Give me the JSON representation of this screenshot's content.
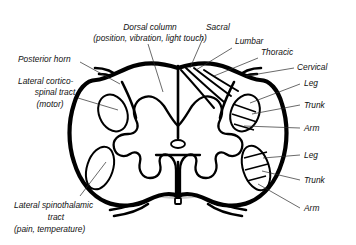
{
  "figure": {
    "background_color": "#ffffff",
    "gray_matter_color": "#cccccc",
    "outline_color": "#000000"
  },
  "labels": {
    "dorsal_column": {
      "line1": "Dorsal column",
      "line2": "(position, vibration, light touch)"
    },
    "posterior_horn": "Posterior horn",
    "lateral_corticospinal": {
      "line1": "Lateral cortico-",
      "line2": "spinal tract",
      "line3": "(motor)"
    },
    "lateral_spinothalamic": {
      "line1": "Lateral spinothalamic",
      "line2": "tract",
      "line3": "(pain, temperature)"
    },
    "sacral": "Sacral",
    "lumbar": "Lumbar",
    "thoracic": "Thoracic",
    "cervical": "Cervical",
    "corticospinal_somatotopy": {
      "leg": "Leg",
      "trunk": "Trunk",
      "arm": "Arm"
    },
    "spinothalamic_somatotopy": {
      "leg": "Leg",
      "trunk": "Trunk",
      "arm": "Arm"
    }
  }
}
